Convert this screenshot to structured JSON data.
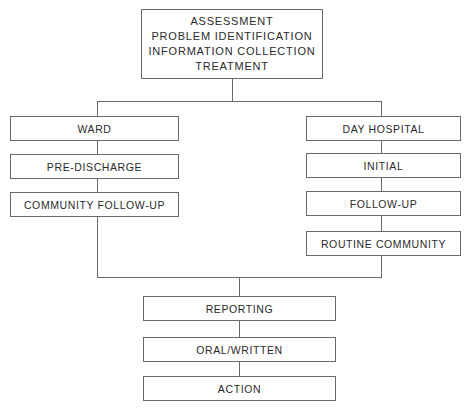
{
  "top": {
    "lines": [
      "ASSESSMENT",
      "PROBLEM IDENTIFICATION",
      "INFORMATION COLLECTION",
      "TREATMENT"
    ]
  },
  "left_branch": {
    "items": [
      "WARD",
      "PRE-DISCHARGE",
      "COMMUNITY FOLLOW-UP"
    ]
  },
  "right_branch": {
    "items": [
      "DAY HOSPITAL",
      "INITIAL",
      "FOLLOW-UP",
      "ROUTINE COMMUNITY"
    ]
  },
  "bottom": {
    "items": [
      "REPORTING",
      "ORAL/WRITTEN",
      "ACTION"
    ]
  },
  "colors": {
    "line": "#6a6a6a",
    "text": "#2a2a2a",
    "background": "#ffffff"
  }
}
